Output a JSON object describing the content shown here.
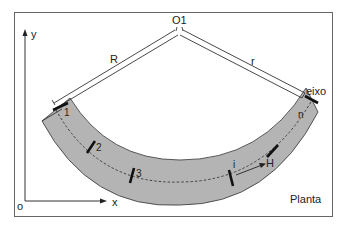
{
  "diagram": {
    "view_label": "Planta",
    "center_label": "O1",
    "outer_radius_label": "R",
    "inner_radius_label": "r",
    "axis_label": "eixo",
    "axes": {
      "origin": "o",
      "x": "x",
      "y": "y"
    },
    "sections": [
      "1",
      "2",
      "3",
      "i",
      "n"
    ],
    "spacing_label": "H",
    "colors": {
      "band_fill": "#b4b4b4",
      "line": "#222222",
      "frame": "#555555",
      "background": "#ffffff"
    }
  }
}
